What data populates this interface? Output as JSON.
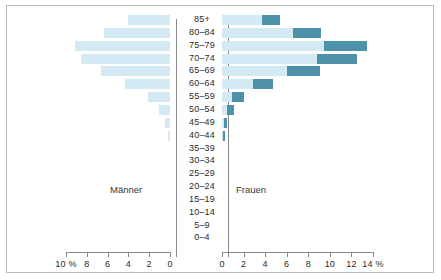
{
  "chart_data": {
    "type": "bar",
    "subtype": "population-pyramid",
    "title": "",
    "xlabel": "%",
    "ylabel": "",
    "grid": false,
    "legend_position": "none",
    "panels": [
      {
        "name": "maenner",
        "label": "Männer",
        "direction": "left",
        "axis_ticks": [
          "10 %",
          "8",
          "6",
          "4",
          "2",
          "0"
        ],
        "axis_tick_values": [
          10,
          8,
          6,
          4,
          2,
          0
        ],
        "xlim": [
          0,
          10
        ]
      },
      {
        "name": "frauen",
        "label": "Frauen",
        "direction": "right",
        "axis_ticks": [
          "0",
          "2",
          "4",
          "6",
          "8",
          "10",
          "12",
          "14 %"
        ],
        "axis_tick_values": [
          0,
          2,
          4,
          6,
          8,
          10,
          12,
          14
        ],
        "xlim": [
          0,
          14
        ]
      }
    ],
    "categories": [
      "85+",
      "80–84",
      "75–79",
      "70–74",
      "65–69",
      "60–64",
      "55–59",
      "50–54",
      "45–49",
      "40–44",
      "35–39",
      "30–34",
      "25–29",
      "20–24",
      "15–19",
      "10–14",
      "5–9",
      "0–4"
    ],
    "series": [
      {
        "name": "Männer",
        "panel": "maenner",
        "color": "#d3eaf4",
        "values": [
          4.0,
          6.3,
          9.1,
          8.6,
          6.6,
          4.3,
          2.1,
          1.1,
          0.5,
          0.2,
          0.0,
          0.0,
          0.0,
          0.0,
          0.0,
          0.0,
          0.0,
          0.0
        ]
      },
      {
        "name": "Frauen (hell)",
        "panel": "frauen",
        "color": "#d3eaf4",
        "values": [
          3.7,
          6.6,
          9.5,
          8.8,
          6.0,
          2.9,
          0.9,
          0.5,
          0.2,
          0.1,
          0.0,
          0.0,
          0.0,
          0.0,
          0.0,
          0.0,
          0.0,
          0.0
        ]
      },
      {
        "name": "Frauen (dunkel)",
        "panel": "frauen",
        "color": "#4e92aa",
        "values": [
          5.4,
          9.2,
          13.4,
          12.5,
          9.1,
          4.7,
          2.0,
          1.1,
          0.45,
          0.25,
          0.0,
          0.0,
          0.0,
          0.0,
          0.0,
          0.0,
          0.0,
          0.0
        ]
      }
    ]
  },
  "colors": {
    "light_blue": "#d3eaf4",
    "dark_teal": "#4e92aa",
    "axis": "#8a8a8a",
    "frame": "#b9b9b9",
    "text": "#2b2b2b",
    "background": "#ffffff"
  }
}
